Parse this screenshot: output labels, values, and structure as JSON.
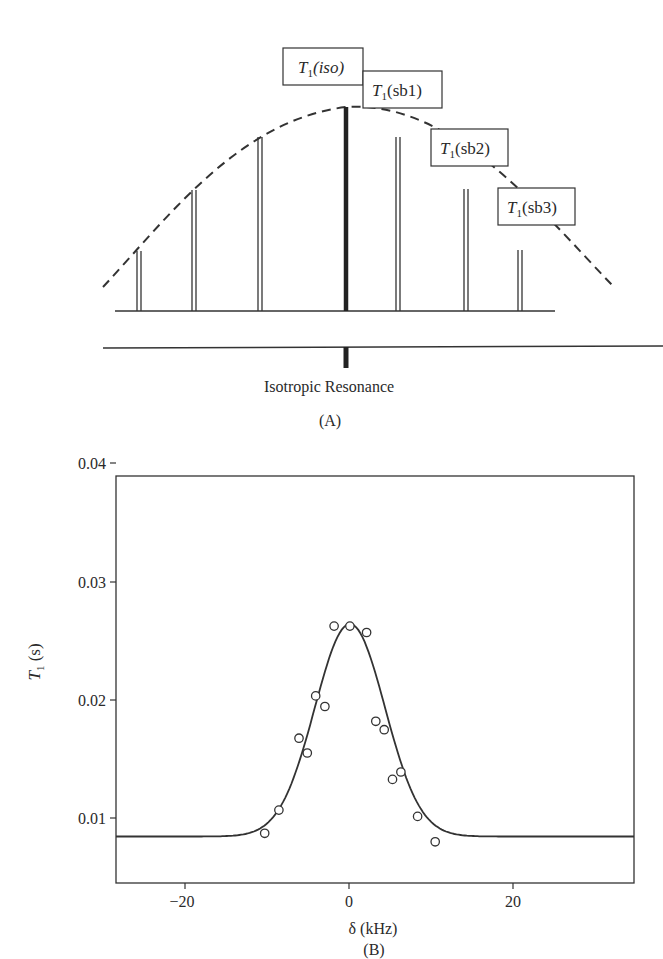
{
  "panel_a": {
    "caption": "(A)",
    "center_label": "Isotropic Resonance",
    "boxes": [
      {
        "main": "T",
        "sub": "1",
        "paren": "(iso)",
        "italic_paren": true
      },
      {
        "main": "T",
        "sub": "1",
        "paren": "(sb1)",
        "italic_paren": false
      },
      {
        "main": "T",
        "sub": "1",
        "paren": "(sb2)",
        "italic_paren": false
      },
      {
        "main": "T",
        "sub": "1",
        "paren": "(sb3)",
        "italic_paren": false
      }
    ]
  },
  "panel_b": {
    "caption": "(B)",
    "xlabel": "δ (kHz)",
    "ylabel_main": "T",
    "ylabel_sub": "1",
    "ylabel_unit": " (s)",
    "xticks": [
      "−20",
      "0",
      "20"
    ],
    "yticks": [
      "0.01",
      "0.02",
      "0.03",
      "0.04"
    ]
  },
  "chart_data": [
    {
      "type": "diagram",
      "title": "(A)",
      "description": "Spinning sideband pattern: central isotropic line flanked by sidebands whose heights follow a dashed envelope",
      "lines": [
        {
          "position": -3,
          "relative_height": 0.29
        },
        {
          "position": -2,
          "relative_height": 0.56
        },
        {
          "position": -1,
          "relative_height": 0.86
        },
        {
          "position": 0,
          "relative_height": 1.0,
          "label": "T1(iso)"
        },
        {
          "position": 1,
          "relative_height": 0.86,
          "label": "T1(sb1)"
        },
        {
          "position": 2,
          "relative_height": 0.56,
          "label": "T1(sb2)"
        },
        {
          "position": 3,
          "relative_height": 0.29,
          "label": "T1(sb3)"
        }
      ],
      "annotations": [
        "T1(iso)",
        "T1(sb1)",
        "T1(sb2)",
        "T1(sb3)",
        "Isotropic Resonance"
      ]
    },
    {
      "type": "scatter",
      "title": "(B)",
      "xlabel": "δ (kHz)",
      "ylabel": "T1 (s)",
      "xlim": [
        -28,
        34
      ],
      "ylim": [
        0.0035,
        0.042
      ],
      "xticks": [
        -20,
        0,
        20
      ],
      "yticks": [
        0.01,
        0.02,
        0.03,
        0.04
      ],
      "grid": false,
      "series": [
        {
          "name": "measured",
          "marker": "open-circle",
          "x": [
            -10.2,
            -8.5,
            -6.1,
            -5.1,
            -4.1,
            -3.0,
            -1.9,
            0.0,
            2.0,
            3.1,
            4.1,
            5.1,
            6.1,
            8.1,
            10.2
          ],
          "y": [
            0.0082,
            0.0104,
            0.0172,
            0.0158,
            0.0212,
            0.0202,
            0.0278,
            0.0278,
            0.0272,
            0.0188,
            0.018,
            0.0133,
            0.014,
            0.0098,
            0.0074
          ]
        },
        {
          "name": "fit",
          "style": "solid-line",
          "model": "gaussian",
          "baseline": 0.0079,
          "peak": 0.028,
          "center": 0.0,
          "sigma_khz": 4.2
        }
      ]
    }
  ]
}
